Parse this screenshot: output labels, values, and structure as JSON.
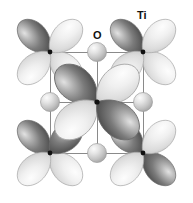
{
  "figure": {
    "width": 193,
    "height": 203,
    "background": "#ffffff"
  },
  "labels": {
    "ti": "Ti",
    "o": "O"
  },
  "colors": {
    "background": "#ffffff",
    "lattice_line": "#8a8a8a",
    "node_dot": "#111111",
    "lobe_dark_core": "#4f4f4f",
    "lobe_dark_mid": "#8f8f8f",
    "lobe_dark_highlight": "#dcdcdc",
    "lobe_light_core": "#d2d2d2",
    "lobe_light_mid": "#ededed",
    "lobe_light_highlight": "#fdfdfd",
    "lobe_outline": "#9a9a9a",
    "sphere_core": "#bdbdbd",
    "sphere_mid": "#dcdcdc",
    "sphere_highlight": "#f7f7f7",
    "sphere_outline": "#9c9c9c",
    "label_text": "#111111"
  },
  "lattice": {
    "cell_left": 50,
    "cell_top": 52,
    "cell_right": 143,
    "cell_bottom": 153,
    "cell_width": 93,
    "cell_height": 101,
    "line_width": 1,
    "description": "Square unit cell outline with horizontal and vertical mid-lines through the central node"
  },
  "ti_sites": [
    {
      "id": "ti-corner-top-left",
      "x": 50,
      "y": 52,
      "orbital": "d-orbital",
      "lobe_orientation": "axial",
      "lobe_count": 4
    },
    {
      "id": "ti-corner-top-right",
      "x": 143,
      "y": 52,
      "orbital": "d-orbital",
      "lobe_orientation": "axial",
      "lobe_count": 4
    },
    {
      "id": "ti-corner-bottom-left",
      "x": 50,
      "y": 153,
      "orbital": "d-orbital",
      "lobe_orientation": "axial",
      "lobe_count": 4
    },
    {
      "id": "ti-corner-bottom-right",
      "x": 143,
      "y": 153,
      "orbital": "d-orbital",
      "lobe_orientation": "axial",
      "lobe_count": 4
    },
    {
      "id": "ti-center",
      "x": 97,
      "y": 102,
      "orbital": "d-orbital",
      "lobe_orientation": "diagonal",
      "lobe_count": 4
    }
  ],
  "o_sites": [
    {
      "id": "o-top",
      "x": 97,
      "y": 52,
      "radius": 9.5
    },
    {
      "id": "o-bottom",
      "x": 97,
      "y": 153,
      "radius": 9.5
    },
    {
      "id": "o-left",
      "x": 50,
      "y": 102,
      "radius": 9.5
    },
    {
      "id": "o-right",
      "x": 143,
      "y": 102,
      "radius": 9.5
    }
  ],
  "legend": {
    "ti_label_position": {
      "x": 137,
      "y": 10
    },
    "o_label_position": {
      "x": 93,
      "y": 30
    }
  }
}
